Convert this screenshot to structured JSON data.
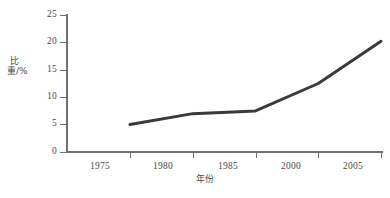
{
  "chart_data": {
    "type": "line",
    "title": "",
    "subtitle": "",
    "xlabel": "年份",
    "ylabel": "比重/%",
    "categories": [
      "1975",
      "1980",
      "1985",
      "2000",
      "2005"
    ],
    "x": [
      1975,
      1980,
      1985,
      2000,
      2005
    ],
    "values": [
      5.0,
      7.0,
      7.5,
      12.5,
      20.2
    ],
    "series": [
      {
        "name": "比重",
        "values": [
          5.0,
          7.0,
          7.5,
          12.5,
          20.2
        ]
      }
    ],
    "ylim": [
      0,
      25
    ],
    "yticks": [
      0,
      5,
      10,
      15,
      20,
      25
    ],
    "ytick_labels": [
      "0",
      "5",
      "10",
      "15",
      "20",
      "25"
    ],
    "xtick_labels": [
      "1975",
      "1980",
      "1985",
      "2000",
      "2005"
    ],
    "grid": false,
    "legend": false,
    "legend_position": "none",
    "annotations": [],
    "colors": {
      "line": "#3a3a3a",
      "axis": "#6f6f6f",
      "text": "#4a4a4a",
      "background": "#ffffff"
    },
    "line_width": 3
  },
  "axes": {
    "y": {
      "label": "比重/%",
      "ticks": [
        {
          "value": "25"
        },
        {
          "value": "20"
        },
        {
          "value": "15"
        },
        {
          "value": "10"
        },
        {
          "value": "5"
        },
        {
          "value": "0"
        }
      ]
    },
    "x": {
      "label": "年份",
      "ticks": [
        {
          "value": "1975"
        },
        {
          "value": "1980"
        },
        {
          "value": "1985"
        },
        {
          "value": "2000"
        },
        {
          "value": "2005"
        }
      ]
    }
  }
}
